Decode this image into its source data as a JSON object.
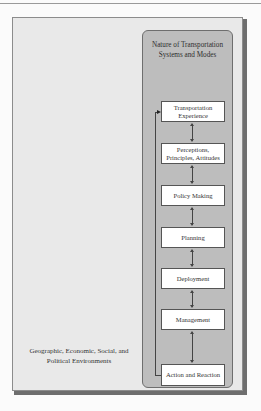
{
  "diagram": {
    "outer_label": "Geographic, Economic, Social, and Political Environments",
    "inner_title": "Nature of Transportation Systems and Modes",
    "stages": [
      {
        "label": "Transportation Experience"
      },
      {
        "label": "Perceptions, Principles, Attitudes"
      },
      {
        "label": "Policy Making"
      },
      {
        "label": "Planning"
      },
      {
        "label": "Deployment"
      },
      {
        "label": "Management"
      },
      {
        "label": "Action and Reaction"
      }
    ],
    "connections": "bidirectional arrows between consecutive stages; feedback loop from Action and Reaction back to Transportation Experience",
    "colors": {
      "outer_panel": "#e9e9e9",
      "inner_panel": "#bdbdbd",
      "stage_box": "#ffffff",
      "lines": "#444444"
    }
  }
}
